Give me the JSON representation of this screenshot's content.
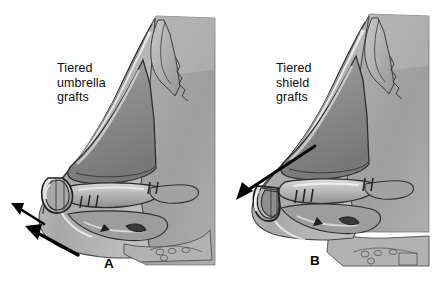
{
  "figure": {
    "type": "medical-illustration",
    "background_color": "#ffffff",
    "ink_color": "#1a1a1a",
    "tissue_gray": "#9a9a9a",
    "cartilage_gray": "#8d8d8d",
    "highlight_gray": "#e8e8e8"
  },
  "panels": [
    {
      "id": "A",
      "letter": "A",
      "label": "Tiered\numbrella\ngrafts",
      "label_lines": [
        "Tiered",
        "umbrella",
        "grafts"
      ],
      "arrows": [
        {
          "name": "projection-arrow-upper",
          "direction": "up-left"
        },
        {
          "name": "projection-arrow-lower",
          "direction": "up-left"
        }
      ],
      "arrow_count": 2
    },
    {
      "id": "B",
      "letter": "B",
      "label": "Tiered\nshield\ngrafts",
      "label_lines": [
        "Tiered",
        "shield",
        "grafts"
      ],
      "arrows": [
        {
          "name": "projection-arrow-descending",
          "direction": "down-left"
        }
      ],
      "arrow_count": 1
    }
  ]
}
